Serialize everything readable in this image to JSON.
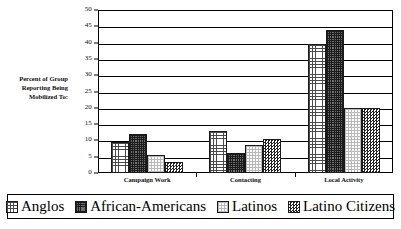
{
  "chart_data": {
    "type": "bar",
    "title": "",
    "xlabel": "",
    "ylabel": "Percent of Group Reporting Being Mobilized To:",
    "ylim": [
      0,
      50
    ],
    "yticks": [
      0,
      5,
      10,
      15,
      20,
      25,
      30,
      35,
      40,
      45,
      50
    ],
    "grid": true,
    "legend_position": "bottom",
    "categories": [
      "Campaign Work",
      "Contacting",
      "Local Activity"
    ],
    "series": [
      {
        "name": "Anglos",
        "values": [
          9.5,
          13,
          39.5
        ],
        "pattern": "light-grid",
        "color": "#ffffff"
      },
      {
        "name": "African-Americans",
        "values": [
          12,
          6,
          44
        ],
        "pattern": "dark-grid",
        "color": "#6d6d6d"
      },
      {
        "name": "Latinos",
        "values": [
          5.5,
          8.5,
          20
        ],
        "pattern": "faint-dots",
        "color": "#fbfbfb"
      },
      {
        "name": "Latino Citizens",
        "values": [
          3.5,
          10.5,
          20
        ],
        "pattern": "checkerboard",
        "color": "#efefef"
      }
    ]
  },
  "axis": {
    "y_title_lines": [
      "Percent of Group",
      "Reporting Being",
      "Mobilized To:"
    ]
  }
}
